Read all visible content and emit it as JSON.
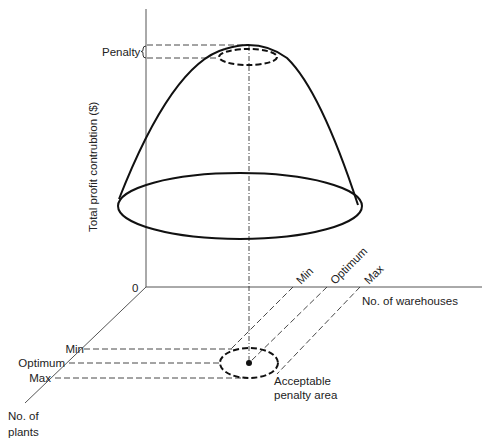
{
  "diagram": {
    "y_axis_label": "Total profit contrubtion ($)",
    "origin_label": "0",
    "penalty_label": "Penalty",
    "warehouse_axis_label": "No. of warehouses",
    "plants_axis_label_line1": "No. of",
    "plants_axis_label_line2": "plants",
    "warehouse_ticks": {
      "min": "Min",
      "optimum": "Optimum",
      "max": "Max"
    },
    "plant_ticks": {
      "min": "Min",
      "optimum": "Optimum",
      "max": "Max"
    },
    "acceptable_area_line1": "Acceptable",
    "acceptable_area_line2": "penalty area",
    "colors": {
      "axis": "#555555",
      "curve": "#111111",
      "background": "#ffffff"
    }
  }
}
